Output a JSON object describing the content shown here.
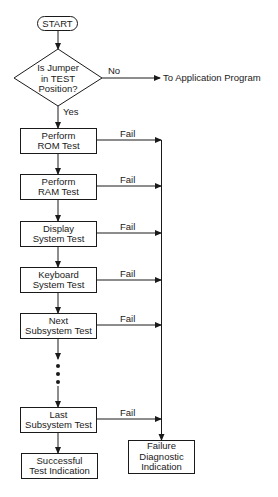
{
  "diagram": {
    "type": "flowchart",
    "start": {
      "label": "START"
    },
    "decision": {
      "lines": [
        "Is Jumper",
        "in TEST",
        "Position?"
      ],
      "no_label": "No",
      "yes_label": "Yes",
      "no_target": "To Application Program"
    },
    "steps": [
      {
        "lines": [
          "Perform",
          "ROM Test"
        ],
        "fail_label": "Fail"
      },
      {
        "lines": [
          "Perform",
          "RAM Test"
        ],
        "fail_label": "Fail"
      },
      {
        "lines": [
          "Display",
          "System Test"
        ],
        "fail_label": "Fail"
      },
      {
        "lines": [
          "Keyboard",
          "System Test"
        ],
        "fail_label": "Fail"
      },
      {
        "lines": [
          "Next",
          "Subsystem Test"
        ],
        "fail_label": "Fail"
      },
      {
        "lines": [
          "Last",
          "Subsystem Test"
        ],
        "fail_label": "Fail"
      }
    ],
    "success": {
      "lines": [
        "Successful",
        "Test Indication"
      ]
    },
    "failure": {
      "lines": [
        "Failure",
        "Diagnostic",
        "Indication"
      ]
    },
    "ellipsis": "continuation-dots",
    "colors": {
      "line": "#1a1a1a",
      "background": "#ffffff"
    }
  }
}
